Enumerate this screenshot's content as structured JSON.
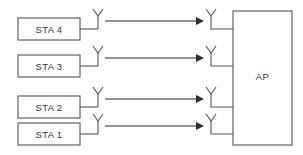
{
  "diagram": {
    "background_color": "#fefefe",
    "line_color": "#555558",
    "signal_color": "#2c2c2e",
    "text_color": "#37373a",
    "stations": [
      {
        "label": "STA 4",
        "box": {
          "x": 18,
          "y": 18,
          "width": 62,
          "height": 22
        },
        "lead_x": 98,
        "antenna_y": 29,
        "arrow": {
          "x1": 105,
          "x2": 202,
          "y": 21
        }
      },
      {
        "label": "STA 3",
        "box": {
          "x": 18,
          "y": 55,
          "width": 62,
          "height": 22
        },
        "lead_x": 98,
        "antenna_y": 66,
        "arrow": {
          "x1": 105,
          "x2": 202,
          "y": 58
        }
      },
      {
        "label": "STA 2",
        "box": {
          "x": 18,
          "y": 96,
          "width": 62,
          "height": 22
        },
        "lead_x": 98,
        "antenna_y": 107,
        "arrow": {
          "x1": 105,
          "x2": 202,
          "y": 99
        }
      },
      {
        "label": "STA 1",
        "box": {
          "x": 18,
          "y": 123,
          "width": 62,
          "height": 22
        },
        "lead_x": 98,
        "antenna_y": 134,
        "arrow": {
          "x1": 105,
          "x2": 202,
          "y": 126
        }
      }
    ],
    "access_point": {
      "label": "AP",
      "box": {
        "x": 233,
        "y": 11,
        "width": 59,
        "height": 134
      },
      "antennas": [
        {
          "name": "ap-antenna-4",
          "x": 211,
          "stem_y": 29
        },
        {
          "name": "ap-antenna-3",
          "x": 211,
          "stem_y": 66
        },
        {
          "name": "ap-antenna-2",
          "x": 211,
          "stem_y": 107
        },
        {
          "name": "ap-antenna-1",
          "x": 211,
          "stem_y": 134
        }
      ]
    },
    "antenna_icon": {
      "name": "antenna-icon",
      "description": "Y-shaped dipole antenna symbol"
    }
  }
}
